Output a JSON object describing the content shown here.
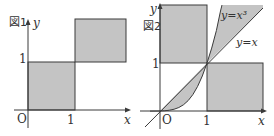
{
  "colors": {
    "shade": "#c4c4c4",
    "line": "#3a3a3a",
    "text": "#333333",
    "background": "#ffffff"
  },
  "figure1": {
    "caption": "図1",
    "axis_x_label": "x",
    "axis_y_label": "y",
    "origin_label": "O",
    "x_tick_label": "1",
    "y_tick_label": "1",
    "regions": [
      {
        "name": "lower-left-unit-square",
        "x_range": [
          0,
          1
        ],
        "y_range": [
          0,
          1
        ],
        "shaded": true
      },
      {
        "name": "upper-right-region",
        "x_range": [
          1,
          2
        ],
        "y_range": [
          1,
          2
        ],
        "shaded": true
      }
    ]
  },
  "figure2": {
    "caption": "図2",
    "axis_x_label": "x",
    "axis_y_label": "y",
    "origin_label": "O",
    "x_tick_label": "1",
    "y_tick_label": "1",
    "curve_label": "y=x³",
    "line_label": "y=x",
    "regions": [
      {
        "name": "upper-left-region",
        "x_range": [
          0,
          1
        ],
        "y_range": [
          1,
          2
        ],
        "shaded": true
      },
      {
        "name": "lower-right-region",
        "x_range": [
          1,
          2
        ],
        "y_range": [
          0,
          1
        ],
        "shaded": true
      },
      {
        "name": "between-x-and-x3-on-0-1",
        "shaded": true
      },
      {
        "name": "between-x3-and-x-above-1",
        "shaded": true
      }
    ]
  }
}
